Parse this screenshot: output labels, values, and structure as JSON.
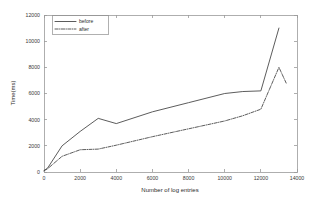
{
  "chart_data": {
    "type": "line",
    "title": "",
    "xlabel": "Number of log entries",
    "ylabel": "Time(ms)",
    "xlim": [
      0,
      14000
    ],
    "ylim": [
      0,
      12000
    ],
    "grid": false,
    "legend_position": "upper left",
    "xticks": [
      0,
      2000,
      4000,
      6000,
      8000,
      10000,
      12000,
      14000
    ],
    "xticklabels": [
      "0",
      "2000",
      "4000",
      "6000",
      "8000",
      "10000",
      "12000",
      "14000"
    ],
    "yticks": [
      0,
      2000,
      4000,
      6000,
      8000,
      10000,
      12000
    ],
    "yticklabels": [
      "0",
      "2000",
      "4000",
      "6000",
      "8000",
      "10000",
      "12000"
    ],
    "series": [
      {
        "name": "before",
        "style": "solid",
        "color": "#4a4a4a",
        "x": [
          0,
          200,
          1000,
          2000,
          3000,
          4000,
          6000,
          8000,
          10000,
          11000,
          12000,
          13000
        ],
        "values": [
          100,
          300,
          2000,
          3100,
          4100,
          3700,
          4600,
          5300,
          6000,
          6150,
          6200,
          11000
        ]
      },
      {
        "name": "after",
        "style": "dash-dot",
        "color": "#4a4a4a",
        "x": [
          0,
          200,
          1000,
          2000,
          3000,
          4000,
          6000,
          8000,
          10000,
          11000,
          12000,
          13000,
          13400
        ],
        "values": [
          100,
          250,
          1200,
          1700,
          1750,
          2050,
          2700,
          3300,
          3900,
          4300,
          4800,
          8000,
          6800
        ]
      }
    ]
  },
  "legend": {
    "entries": [
      {
        "label": "before"
      },
      {
        "label": "after"
      }
    ]
  },
  "axes": {
    "x_title": "Number of log entries",
    "y_title": "Time(ms)"
  }
}
